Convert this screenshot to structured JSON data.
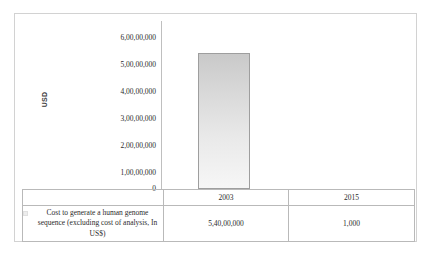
{
  "chart_data": {
    "type": "bar",
    "title": "",
    "xlabel": "",
    "ylabel": "USD",
    "categories": [
      "2003",
      "2015"
    ],
    "series": [
      {
        "name": "Cost to generate a human genome sequence (excluding cost of analysis, In US$)",
        "values": [
          54000000,
          1000
        ],
        "value_labels": [
          "5,40,00,000",
          "1,000"
        ]
      }
    ],
    "ylim": [
      0,
      60000000
    ],
    "ytick_labels": [
      "6,00,00,000",
      "5,00,00,000",
      "4,00,00,000",
      "3,00,00,000",
      "2,00,00,000",
      "1,00,00,000",
      "0"
    ],
    "ytick_values": [
      60000000,
      50000000,
      40000000,
      30000000,
      20000000,
      10000000,
      0
    ],
    "grid": false,
    "legend_position": "data-table-row",
    "bar_color_top": "#c9c9c9",
    "bar_color_bottom": "#f6f6f6",
    "bar_border_color": "#9e9e9e",
    "axis_color": "#bfbfbf",
    "frame_color": "#d2d2d2",
    "table_border_color": "#b9b9b9"
  },
  "table": {
    "header_blank": "",
    "column_headers": [
      "2003",
      "2015"
    ],
    "row_label": "Cost to generate a human genome sequence (excluding cost of analysis, In US$)",
    "row_values": [
      "5,40,00,000",
      "1,000"
    ]
  }
}
